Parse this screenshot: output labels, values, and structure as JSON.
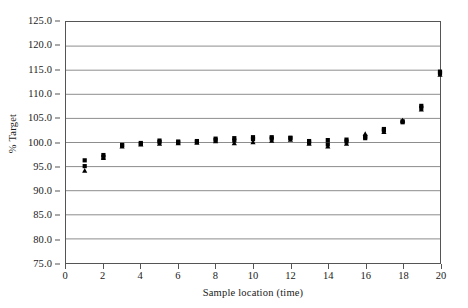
{
  "chart_data": {
    "type": "scatter",
    "title": "",
    "xlabel": "Sample location (time)",
    "ylabel": "% Target",
    "xlim": [
      0,
      20
    ],
    "ylim": [
      75.0,
      125.0
    ],
    "grid": true,
    "legend": null,
    "x_ticks": [
      0,
      2,
      4,
      6,
      8,
      10,
      12,
      14,
      16,
      18,
      20
    ],
    "x_tick_labels": [
      "0",
      "2",
      "4",
      "6",
      "8",
      "10",
      "12",
      "14",
      "16",
      "18",
      "20"
    ],
    "y_ticks": [
      75.0,
      80.0,
      85.0,
      90.0,
      95.0,
      100.0,
      105.0,
      110.0,
      115.0,
      120.0,
      125.0
    ],
    "y_tick_labels": [
      "75.0",
      "80.0",
      "85.0",
      "90.0",
      "95.0",
      "100.0",
      "105.0",
      "110.0",
      "115.0",
      "120.0",
      "125.0"
    ],
    "marker_colors": {
      "square": "#000000",
      "triangle": "#000000"
    },
    "series": [
      {
        "name": "square",
        "marker": "square",
        "points": [
          {
            "x": 1,
            "y": 96.3
          },
          {
            "x": 2,
            "y": 97.4
          },
          {
            "x": 3,
            "y": 99.5
          },
          {
            "x": 4,
            "y": 99.7
          },
          {
            "x": 5,
            "y": 100.4
          },
          {
            "x": 6,
            "y": 100.2
          },
          {
            "x": 7,
            "y": 100.1
          },
          {
            "x": 8,
            "y": 100.8
          },
          {
            "x": 9,
            "y": 100.9
          },
          {
            "x": 10,
            "y": 101.1
          },
          {
            "x": 11,
            "y": 101.1
          },
          {
            "x": 12,
            "y": 100.9
          },
          {
            "x": 13,
            "y": 100.0
          },
          {
            "x": 14,
            "y": 100.5
          },
          {
            "x": 15,
            "y": 100.6
          },
          {
            "x": 16,
            "y": 101.2
          },
          {
            "x": 17,
            "y": 102.8
          },
          {
            "x": 18,
            "y": 104.2
          },
          {
            "x": 19,
            "y": 107.6
          },
          {
            "x": 20,
            "y": 114.7
          }
        ]
      },
      {
        "name": "triangle",
        "marker": "triangle",
        "points": [
          {
            "x": 1,
            "y": 94.2
          },
          {
            "x": 2,
            "y": 96.8
          },
          {
            "x": 3,
            "y": 99.2
          },
          {
            "x": 4,
            "y": 99.6
          },
          {
            "x": 5,
            "y": 99.8
          },
          {
            "x": 6,
            "y": 99.9
          },
          {
            "x": 7,
            "y": 100.0
          },
          {
            "x": 8,
            "y": 100.3
          },
          {
            "x": 9,
            "y": 99.9
          },
          {
            "x": 10,
            "y": 100.1
          },
          {
            "x": 11,
            "y": 100.4
          },
          {
            "x": 12,
            "y": 100.6
          },
          {
            "x": 13,
            "y": 99.8
          },
          {
            "x": 14,
            "y": 99.2
          },
          {
            "x": 15,
            "y": 99.8
          },
          {
            "x": 16,
            "y": 101.8
          },
          {
            "x": 17,
            "y": 102.2
          },
          {
            "x": 18,
            "y": 104.6
          },
          {
            "x": 19,
            "y": 106.9
          },
          {
            "x": 20,
            "y": 114.1
          }
        ]
      },
      {
        "name": "square-secondary",
        "marker": "square",
        "points": [
          {
            "x": 1,
            "y": 95.1
          },
          {
            "x": 2,
            "y": 97.0
          },
          {
            "x": 3,
            "y": 99.4
          },
          {
            "x": 4,
            "y": 99.9
          },
          {
            "x": 5,
            "y": 100.1
          },
          {
            "x": 6,
            "y": 100.0
          },
          {
            "x": 7,
            "y": 100.3
          },
          {
            "x": 8,
            "y": 100.5
          },
          {
            "x": 9,
            "y": 100.4
          },
          {
            "x": 10,
            "y": 100.7
          },
          {
            "x": 11,
            "y": 100.8
          },
          {
            "x": 12,
            "y": 101.0
          },
          {
            "x": 13,
            "y": 100.3
          },
          {
            "x": 14,
            "y": 99.6
          },
          {
            "x": 15,
            "y": 100.2
          },
          {
            "x": 16,
            "y": 100.9
          },
          {
            "x": 17,
            "y": 102.5
          },
          {
            "x": 18,
            "y": 104.4
          },
          {
            "x": 19,
            "y": 107.2
          },
          {
            "x": 20,
            "y": 114.4
          }
        ]
      }
    ]
  },
  "axes": {
    "y_title": "% Target",
    "x_title": "Sample location (time)"
  }
}
